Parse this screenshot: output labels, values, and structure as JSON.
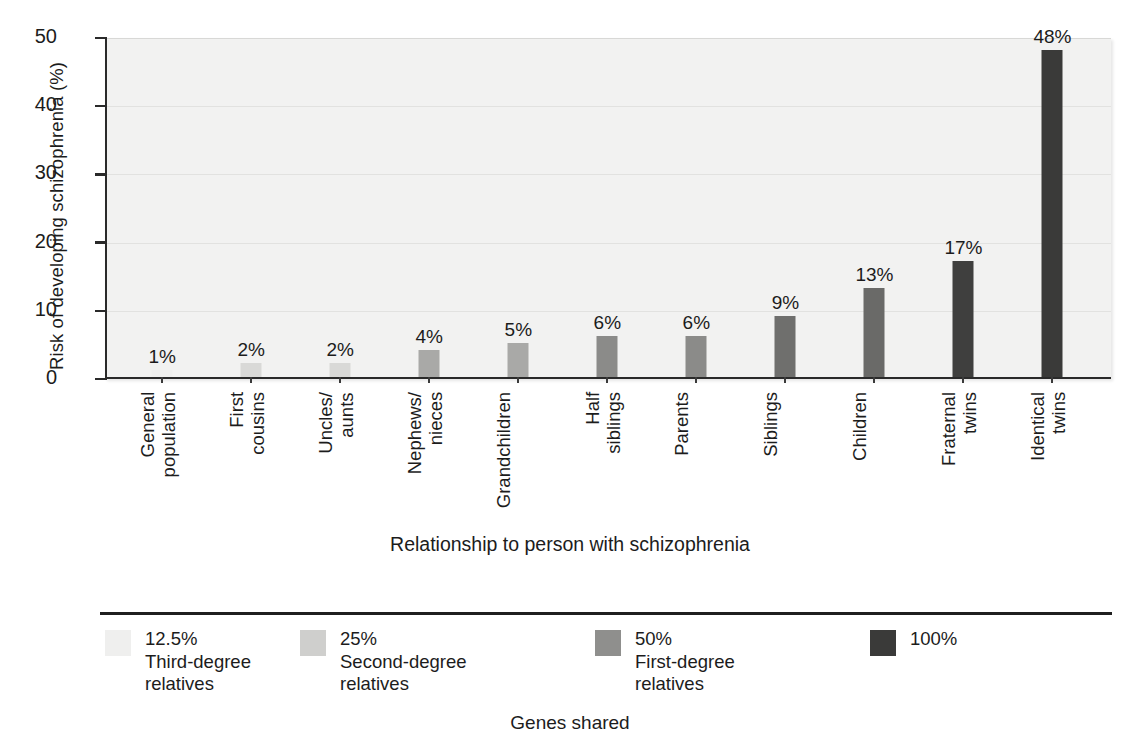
{
  "chart_data": {
    "type": "bar",
    "title": "",
    "xlabel": "Relationship to person with schizophrenia",
    "ylabel": "Risk of developing schizophrenia (%)",
    "ylim": [
      0,
      50
    ],
    "yticks": [
      0,
      10,
      20,
      30,
      40,
      50
    ],
    "grid": true,
    "legend_position": "bottom",
    "caption": "Genes shared",
    "categories": [
      "General\npopulation",
      "First\ncousins",
      "Uncles/\naunts",
      "Nephews/\nnieces",
      "Grandchildren",
      "Half\nsiblings",
      "Parents",
      "Siblings",
      "Children",
      "Fraternal\ntwins",
      "Identical\ntwins"
    ],
    "values": [
      1,
      2,
      2,
      4,
      5,
      6,
      6,
      9,
      13,
      17,
      48
    ],
    "value_labels": [
      "1%",
      "2%",
      "2%",
      "4%",
      "5%",
      "6%",
      "6%",
      "9%",
      "13%",
      "17%",
      "48%"
    ],
    "bar_groups": [
      "12.5%",
      "12.5%",
      "25%",
      "25%",
      "25%",
      "25%",
      "50%",
      "50%",
      "50%",
      "50%",
      "100%"
    ],
    "bar_colors": [
      "#efefee",
      "#d9d9d7",
      "#d9d9d7",
      "#a9a9a7",
      "#a9a9a7",
      "#8b8b89",
      "#8b8b89",
      "#6f6f6d",
      "#6a6a68",
      "#3f3f3e",
      "#3a3a39"
    ],
    "legend": [
      {
        "swatch_color": "#efefee",
        "percent": "12.5%",
        "description": "Third-degree\nrelatives"
      },
      {
        "swatch_color": "#cfcfcd",
        "percent": "25%",
        "description": "Second-degree\nrelatives"
      },
      {
        "swatch_color": "#8f8f8d",
        "percent": "50%",
        "description": "First-degree\nrelatives"
      },
      {
        "swatch_color": "#3a3a39",
        "percent": "100%",
        "description": ""
      }
    ],
    "plot_background": "#f2f2f1",
    "axis_color": "#2a2a2a"
  }
}
